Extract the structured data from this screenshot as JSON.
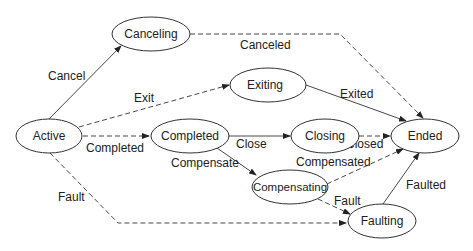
{
  "diagram": {
    "type": "state-transition",
    "nodes": [
      {
        "id": "active",
        "label": "Active",
        "cx": 49,
        "cy": 136,
        "rx": 33,
        "ry": 17
      },
      {
        "id": "canceling",
        "label": "Canceling",
        "cx": 151,
        "cy": 34,
        "rx": 39,
        "ry": 17
      },
      {
        "id": "exiting",
        "label": "Exiting",
        "cx": 268,
        "cy": 85,
        "rx": 38,
        "ry": 17
      },
      {
        "id": "completed",
        "label": "Completed",
        "cx": 190,
        "cy": 136,
        "rx": 39,
        "ry": 17
      },
      {
        "id": "closing",
        "label": "Closing",
        "cx": 325,
        "cy": 136,
        "rx": 34,
        "ry": 17
      },
      {
        "id": "ended",
        "label": "Ended",
        "cx": 425,
        "cy": 136,
        "rx": 34,
        "ry": 17
      },
      {
        "id": "compensating",
        "label": "Compensating",
        "cx": 290,
        "cy": 187,
        "rx": 38,
        "ry": 17
      },
      {
        "id": "faulting",
        "label": "Faulting",
        "cx": 382,
        "cy": 221,
        "rx": 34,
        "ry": 17
      }
    ],
    "edges": [
      {
        "from": "active",
        "to": "canceling",
        "label": "Cancel",
        "style": "solid"
      },
      {
        "from": "active",
        "to": "exiting",
        "label": "Exit",
        "style": "dashed"
      },
      {
        "from": "active",
        "to": "completed",
        "label": "Completed",
        "style": "dashed"
      },
      {
        "from": "active",
        "to": "faulting",
        "label": "Fault",
        "style": "dashed"
      },
      {
        "from": "canceling",
        "to": "ended",
        "label": "Canceled",
        "style": "dashed"
      },
      {
        "from": "exiting",
        "to": "ended",
        "label": "Exited",
        "style": "solid"
      },
      {
        "from": "completed",
        "to": "closing",
        "label": "Close",
        "style": "solid"
      },
      {
        "from": "completed",
        "to": "compensating",
        "label": "Compensate",
        "style": "solid"
      },
      {
        "from": "closing",
        "to": "ended",
        "label": "Closed",
        "style": "dashed"
      },
      {
        "from": "compensating",
        "to": "ended",
        "label": "Compensated",
        "style": "dashed"
      },
      {
        "from": "compensating",
        "to": "faulting",
        "label": "Fault",
        "style": "dashed"
      },
      {
        "from": "faulting",
        "to": "ended",
        "label": "Faulted",
        "style": "solid"
      }
    ]
  },
  "labels": {
    "active": "Active",
    "canceling": "Canceling",
    "exiting": "Exiting",
    "completed": "Completed",
    "closing": "Closing",
    "ended": "Ended",
    "compensating": "Compensating",
    "faulting": "Faulting",
    "edge_cancel": "Cancel",
    "edge_exit": "Exit",
    "edge_completed": "Completed",
    "edge_fault_active": "Fault",
    "edge_canceled": "Canceled",
    "edge_exited": "Exited",
    "edge_close": "Close",
    "edge_compensate": "Compensate",
    "edge_closed": "Closed",
    "edge_compensated": "Compensated",
    "edge_fault_compensating": "Fault",
    "edge_faulted": "Faulted"
  }
}
